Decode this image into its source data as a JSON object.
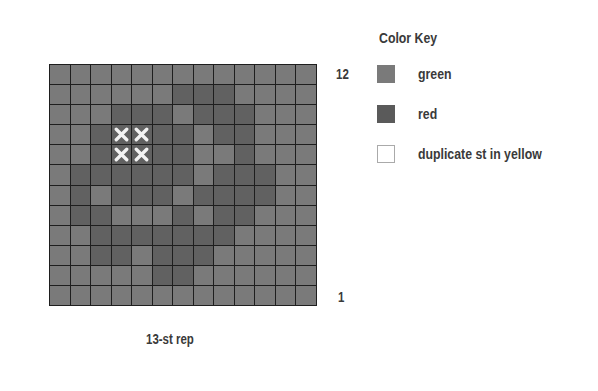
{
  "chart_data": {
    "type": "heatmap",
    "columns": 13,
    "rows": 12,
    "row_labels": {
      "top": "12",
      "bottom": "1"
    },
    "xlabel": "13-st rep",
    "legend": [
      {
        "symbol": "green",
        "label": "green",
        "color": "#7a7a7a"
      },
      {
        "symbol": "red",
        "label": "red",
        "color": "#5a5a5a"
      },
      {
        "symbol": "dup",
        "label": "duplicate st in yellow",
        "color": "#ffffff"
      }
    ],
    "grid_top_to_bottom": [
      "LLLLLLLLLLLLL",
      "LLLLLLDDDLLLL",
      "LLLDDDLDDDLLL",
      "LLDXXDDLDDLLL",
      "LLDXXDDLLDLLL",
      "LDDDDDDLDDDLL",
      "LDLDDDLDDDDLL",
      "LDDLLLDLDDLLL",
      "LLDDDDDDDLLLL",
      "LLDDLDDDLLLLL",
      "LLLLLDDLLLLLL",
      "LLLLLLLLLLLLL"
    ],
    "grid_key": {
      "L": "green",
      "D": "red",
      "X": "red with duplicate st in yellow"
    }
  },
  "labels": {
    "row_top": "12",
    "row_bottom": "1",
    "repeat": "13-st rep"
  },
  "key": {
    "title": "Color Key",
    "items": [
      {
        "label": "green"
      },
      {
        "label": "red"
      },
      {
        "label": "duplicate st in yellow"
      }
    ]
  }
}
